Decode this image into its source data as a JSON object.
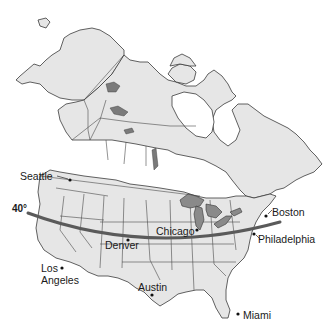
{
  "map": {
    "region": "North America (United States and Canada)",
    "latitude_line": {
      "label": "40°",
      "value_degrees": 40
    },
    "cities": [
      {
        "name": "Seattle"
      },
      {
        "name": "Los Angeles",
        "lines": [
          "Los",
          "Angeles"
        ]
      },
      {
        "name": "Denver"
      },
      {
        "name": "Chicago"
      },
      {
        "name": "Austin"
      },
      {
        "name": "Boston"
      },
      {
        "name": "Philadelphia"
      },
      {
        "name": "Miami"
      }
    ],
    "colors": {
      "land": "#e6e6e6",
      "great_lakes": "#8a8a8a",
      "latitude_line": "#5a5a5a",
      "background": "#ffffff"
    }
  }
}
